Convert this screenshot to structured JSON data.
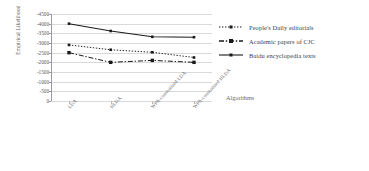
{
  "chart_data": {
    "type": "line",
    "title": "",
    "xlabel": "Algorithms",
    "ylabel": "Empirical Likelihood",
    "categories": [
      "LDA",
      "HLDA",
      "WPA-constrained LDA",
      "WPA-constrained HLDA"
    ],
    "ylim": [
      -4500,
      0
    ],
    "ytick_step": 500,
    "yticks": [
      "-4500",
      "-4000",
      "-3500",
      "-3000",
      "-2500",
      "-2000",
      "-1500",
      "-1000",
      "-500",
      "0"
    ],
    "grid": true,
    "legend_position": "right",
    "series": [
      {
        "name": "People's Daily editorials",
        "values": [
          -2900,
          -2650,
          -2520,
          -2250
        ],
        "line_style": "dotted",
        "marker": "square",
        "color": "#1a1a1a"
      },
      {
        "name": "Academic papers of CJC",
        "values": [
          -2500,
          -2000,
          -2100,
          -2000
        ],
        "line_style": "dashdot",
        "marker": "square",
        "color": "#1a1a1a"
      },
      {
        "name": "Baidu encyclopedia texts",
        "values": [
          -4000,
          -3620,
          -3320,
          -3300
        ],
        "line_style": "solid",
        "marker": "square",
        "color": "#1a1a1a"
      }
    ]
  },
  "colors": {
    "plot_background": "#ffffff",
    "gridline": "#d9d9d9",
    "axis": "#9a9a9a",
    "tick_text": "#555555",
    "legend_text": "#3d3d3d",
    "series_line": "#1a1a1a"
  }
}
